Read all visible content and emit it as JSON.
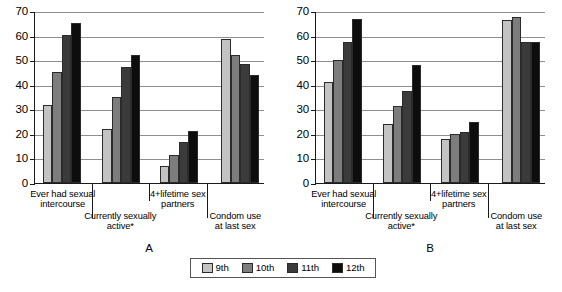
{
  "figure": {
    "panel_a_letter": "A",
    "panel_b_letter": "B"
  },
  "legend": {
    "items": [
      {
        "label": "9th",
        "color": "#c3c3c3"
      },
      {
        "label": "10th",
        "color": "#7d7d7d"
      },
      {
        "label": "11th",
        "color": "#3b3b3b"
      },
      {
        "label": "12th",
        "color": "#0d0d0d"
      }
    ]
  },
  "chart_data": [
    {
      "type": "bar",
      "title": "A",
      "xlabel": "",
      "ylabel": "",
      "ylim": [
        0,
        70
      ],
      "yticks": [
        0,
        10,
        20,
        30,
        40,
        50,
        60,
        70
      ],
      "grid": true,
      "legend_position": "bottom",
      "categories": [
        "Ever had sexual intercourse",
        "Currently sexually active*",
        "4+lifetime sex partners",
        "Condom use at last sex"
      ],
      "category_lines": [
        [
          "Ever had sexual",
          "intercourse"
        ],
        [
          "Currently sexually",
          "active*"
        ],
        [
          "4+lifetime sex",
          "partners"
        ],
        [
          "Condom use",
          "at last sex"
        ]
      ],
      "series": [
        {
          "name": "9th",
          "values": [
            31.8,
            22.0,
            7.0,
            58.8
          ]
        },
        {
          "name": "10th",
          "values": [
            45.2,
            35.2,
            11.5,
            52.0
          ]
        },
        {
          "name": "11th",
          "values": [
            60.1,
            47.4,
            16.6,
            48.4
          ]
        },
        {
          "name": "12th",
          "values": [
            65.3,
            52.3,
            21.2,
            43.8
          ]
        }
      ]
    },
    {
      "type": "bar",
      "title": "B",
      "xlabel": "",
      "ylabel": "",
      "ylim": [
        0,
        70
      ],
      "yticks": [
        0,
        10,
        20,
        30,
        40,
        50,
        60,
        70
      ],
      "grid": true,
      "legend_position": "bottom",
      "categories": [
        "Ever had sexual intercourse",
        "Currently sexually active*",
        "4+lifetime sex partners",
        "Condom use at last sex"
      ],
      "category_lines": [
        [
          "Ever had sexual",
          "intercourse"
        ],
        [
          "Currently sexually",
          "active*"
        ],
        [
          "4+lifetime sex",
          "partners"
        ],
        [
          "Condom use",
          "at last sex"
        ]
      ],
      "series": [
        {
          "name": "9th",
          "values": [
            41.2,
            24.0,
            18.1,
            66.3
          ]
        },
        {
          "name": "10th",
          "values": [
            50.0,
            31.3,
            19.9,
            67.6
          ]
        },
        {
          "name": "11th",
          "values": [
            57.2,
            37.6,
            20.8,
            57.3
          ]
        },
        {
          "name": "12th",
          "values": [
            66.8,
            48.1,
            24.8,
            57.2
          ]
        }
      ]
    }
  ]
}
